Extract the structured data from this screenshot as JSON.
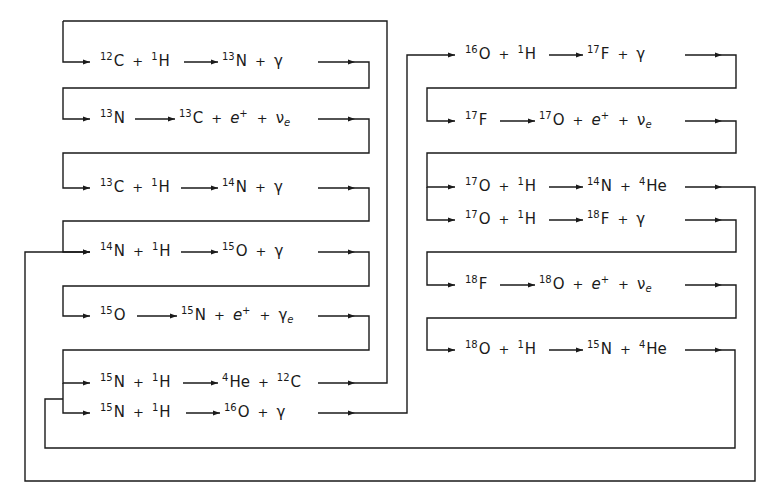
{
  "diagram": {
    "type": "nuclear-reaction-cycle",
    "stroke_color": "#1a1a1a",
    "background": "#ffffff",
    "left_column": [
      {
        "id": "r1",
        "reactants": [
          {
            "mass": "12",
            "sym": "C"
          },
          {
            "mass": "1",
            "sym": "H"
          }
        ],
        "products": [
          {
            "mass": "13",
            "sym": "N"
          },
          {
            "sym": "γ"
          }
        ]
      },
      {
        "id": "r2",
        "reactants": [
          {
            "mass": "13",
            "sym": "N"
          }
        ],
        "products": [
          {
            "mass": "13",
            "sym": "C"
          },
          {
            "sym": "e",
            "sup": "+"
          },
          {
            "sym": "ν",
            "sub": "e"
          }
        ]
      },
      {
        "id": "r3",
        "reactants": [
          {
            "mass": "13",
            "sym": "C"
          },
          {
            "mass": "1",
            "sym": "H"
          }
        ],
        "products": [
          {
            "mass": "14",
            "sym": "N"
          },
          {
            "sym": "γ"
          }
        ]
      },
      {
        "id": "r4",
        "reactants": [
          {
            "mass": "14",
            "sym": "N"
          },
          {
            "mass": "1",
            "sym": "H"
          }
        ],
        "products": [
          {
            "mass": "15",
            "sym": "O"
          },
          {
            "sym": "γ"
          }
        ]
      },
      {
        "id": "r5",
        "reactants": [
          {
            "mass": "15",
            "sym": "O"
          }
        ],
        "products": [
          {
            "mass": "15",
            "sym": "N"
          },
          {
            "sym": "e",
            "sup": "+"
          },
          {
            "sym": "γ",
            "sub": "e"
          }
        ]
      },
      {
        "id": "r6",
        "reactants": [
          {
            "mass": "15",
            "sym": "N"
          },
          {
            "mass": "1",
            "sym": "H"
          }
        ],
        "products": [
          {
            "mass": "4",
            "sym": "He"
          },
          {
            "mass": "12",
            "sym": "C"
          }
        ]
      },
      {
        "id": "r7",
        "reactants": [
          {
            "mass": "15",
            "sym": "N"
          },
          {
            "mass": "1",
            "sym": "H"
          }
        ],
        "products": [
          {
            "mass": "16",
            "sym": "O"
          },
          {
            "sym": "γ"
          }
        ]
      }
    ],
    "right_column": [
      {
        "id": "r8",
        "reactants": [
          {
            "mass": "16",
            "sym": "O"
          },
          {
            "mass": "1",
            "sym": "H"
          }
        ],
        "products": [
          {
            "mass": "17",
            "sym": "F"
          },
          {
            "sym": "γ"
          }
        ]
      },
      {
        "id": "r9",
        "reactants": [
          {
            "mass": "17",
            "sym": "F"
          }
        ],
        "products": [
          {
            "mass": "17",
            "sym": "O"
          },
          {
            "sym": "e",
            "sup": "+"
          },
          {
            "sym": "ν",
            "sub": "e"
          }
        ]
      },
      {
        "id": "r10",
        "reactants": [
          {
            "mass": "17",
            "sym": "O"
          },
          {
            "mass": "1",
            "sym": "H"
          }
        ],
        "products": [
          {
            "mass": "14",
            "sym": "N"
          },
          {
            "mass": "4",
            "sym": "He"
          }
        ]
      },
      {
        "id": "r11",
        "reactants": [
          {
            "mass": "17",
            "sym": "O"
          },
          {
            "mass": "1",
            "sym": "H"
          }
        ],
        "products": [
          {
            "mass": "18",
            "sym": "F"
          },
          {
            "sym": "γ"
          }
        ]
      },
      {
        "id": "r12",
        "reactants": [
          {
            "mass": "18",
            "sym": "F"
          }
        ],
        "products": [
          {
            "mass": "18",
            "sym": "O"
          },
          {
            "sym": "e",
            "sup": "+"
          },
          {
            "sym": "ν",
            "sub": "e"
          }
        ]
      },
      {
        "id": "r13",
        "reactants": [
          {
            "mass": "18",
            "sym": "O"
          },
          {
            "mass": "1",
            "sym": "H"
          }
        ],
        "products": [
          {
            "mass": "15",
            "sym": "N"
          },
          {
            "mass": "4",
            "sym": "He"
          }
        ]
      }
    ],
    "plus_symbol": "+"
  }
}
